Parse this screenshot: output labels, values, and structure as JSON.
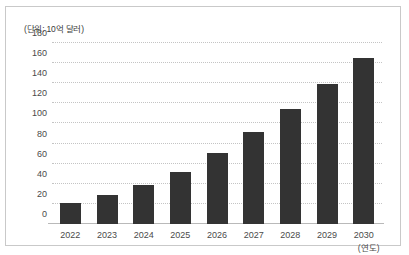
{
  "chart_data": {
    "type": "bar",
    "title": "",
    "unit_label": "(단위: 10억 달러)",
    "xlabel": "(연도)",
    "ylabel": "",
    "categories": [
      "2022",
      "2023",
      "2024",
      "2025",
      "2026",
      "2027",
      "2028",
      "2029",
      "2030"
    ],
    "values": [
      21,
      29,
      39,
      52,
      71,
      92,
      114,
      139,
      165
    ],
    "yticks": [
      0,
      20,
      40,
      60,
      80,
      100,
      120,
      140,
      160,
      180
    ],
    "ylim": [
      0,
      180
    ],
    "grid": true,
    "grid_style": "dotted",
    "legend": false,
    "bar_color": "#333333",
    "grid_color": "#c4c4c4",
    "axis_color": "#b9b9b9",
    "border_color": "#c9c9c9",
    "background_color": "#ffffff"
  }
}
